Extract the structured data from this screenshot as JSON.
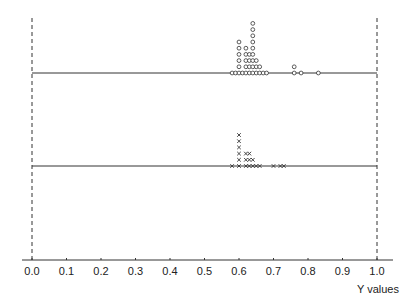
{
  "chart_data": {
    "type": "scatter",
    "subtype": "dot-plot (stacked strip chart)",
    "title": "",
    "xlabel": "Y values",
    "ylabel": "",
    "xlim": [
      0.0,
      1.0
    ],
    "x_ticks": [
      "0.0",
      "0.1",
      "0.2",
      "0.3",
      "0.4",
      "0.5",
      "0.6",
      "0.7",
      "0.8",
      "0.9",
      "1.0"
    ],
    "grid": false,
    "reference_lines": [
      {
        "x": 0.0,
        "style": "dashed",
        "orientation": "vertical"
      },
      {
        "x": 1.0,
        "style": "dashed",
        "orientation": "vertical"
      }
    ],
    "series": [
      {
        "name": "upper strip",
        "marker": "o",
        "baseline_y": 73,
        "range": [
          0.0,
          1.0
        ],
        "points": [
          {
            "x": 0.58,
            "count": 1
          },
          {
            "x": 0.59,
            "count": 1
          },
          {
            "x": 0.6,
            "count": 6
          },
          {
            "x": 0.61,
            "count": 1
          },
          {
            "x": 0.62,
            "count": 5
          },
          {
            "x": 0.63,
            "count": 4
          },
          {
            "x": 0.64,
            "count": 9
          },
          {
            "x": 0.65,
            "count": 3
          },
          {
            "x": 0.66,
            "count": 2
          },
          {
            "x": 0.67,
            "count": 1
          },
          {
            "x": 0.68,
            "count": 1
          },
          {
            "x": 0.76,
            "count": 2
          },
          {
            "x": 0.78,
            "count": 1
          },
          {
            "x": 0.83,
            "count": 1
          }
        ]
      },
      {
        "name": "lower strip",
        "marker": "x",
        "baseline_y": 166,
        "range": [
          0.0,
          1.0
        ],
        "points": [
          {
            "x": 0.58,
            "count": 1
          },
          {
            "x": 0.6,
            "count": 6
          },
          {
            "x": 0.62,
            "count": 3
          },
          {
            "x": 0.63,
            "count": 3
          },
          {
            "x": 0.64,
            "count": 2
          },
          {
            "x": 0.65,
            "count": 1
          },
          {
            "x": 0.66,
            "count": 1
          },
          {
            "x": 0.7,
            "count": 1
          },
          {
            "x": 0.72,
            "count": 1
          },
          {
            "x": 0.73,
            "count": 1
          }
        ]
      }
    ]
  },
  "axis": {
    "x_label": "Y values",
    "ticks": [
      "0.0",
      "0.1",
      "0.2",
      "0.3",
      "0.4",
      "0.5",
      "0.6",
      "0.7",
      "0.8",
      "0.9",
      "1.0"
    ]
  },
  "colors": {
    "line": "#333333",
    "marker": "#333333",
    "background": "#ffffff"
  }
}
